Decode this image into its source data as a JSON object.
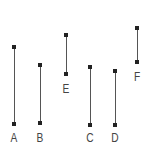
{
  "diagram": {
    "title": "",
    "line_color": "#555555",
    "endpoint_color": "#222222",
    "label_color": "#444444",
    "segments": [
      {
        "label": "A",
        "x": 14,
        "top": 47,
        "bottom": 124,
        "label_y": 132
      },
      {
        "label": "B",
        "x": 40,
        "top": 65,
        "bottom": 123,
        "label_y": 132
      },
      {
        "label": "E",
        "x": 66,
        "top": 35,
        "bottom": 74,
        "label_y": 83
      },
      {
        "label": "C",
        "x": 90,
        "top": 67,
        "bottom": 125,
        "label_y": 132
      },
      {
        "label": "D",
        "x": 115,
        "top": 71,
        "bottom": 125,
        "label_y": 132
      },
      {
        "label": "F",
        "x": 137,
        "top": 28,
        "bottom": 62,
        "label_y": 71
      }
    ]
  }
}
